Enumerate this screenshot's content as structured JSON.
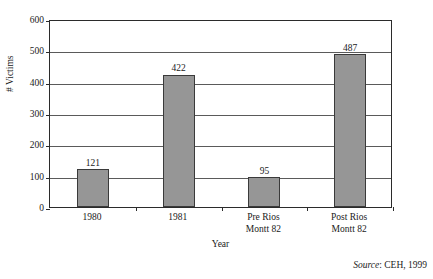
{
  "chart_data": {
    "type": "bar",
    "title": "",
    "subtitle": "",
    "xlabel": "Year",
    "ylabel": "# Victims",
    "categories": [
      "1980",
      "1981",
      "Pre Rios\nMontt 82",
      "Post Rios\nMontt 82"
    ],
    "values": [
      121,
      422,
      95,
      487
    ],
    "data_labels": [
      "121",
      "422",
      "95",
      "487"
    ],
    "ylim": [
      0,
      600
    ],
    "ytick_values": [
      0,
      100,
      200,
      300,
      400,
      500,
      600
    ],
    "ytick_labels": [
      "0",
      "100",
      "200",
      "300",
      "400",
      "500",
      "600"
    ],
    "grid": true,
    "legend": false,
    "bar_color": "#969696",
    "bar_border_color": "#3a3a3a",
    "axis_color": "#2b2b2b",
    "gridline_color": "#5a5a5a",
    "background_color": "#ffffff"
  },
  "notes": {
    "source_word": "Source",
    "source_rest": ":  CEH, 1999"
  }
}
